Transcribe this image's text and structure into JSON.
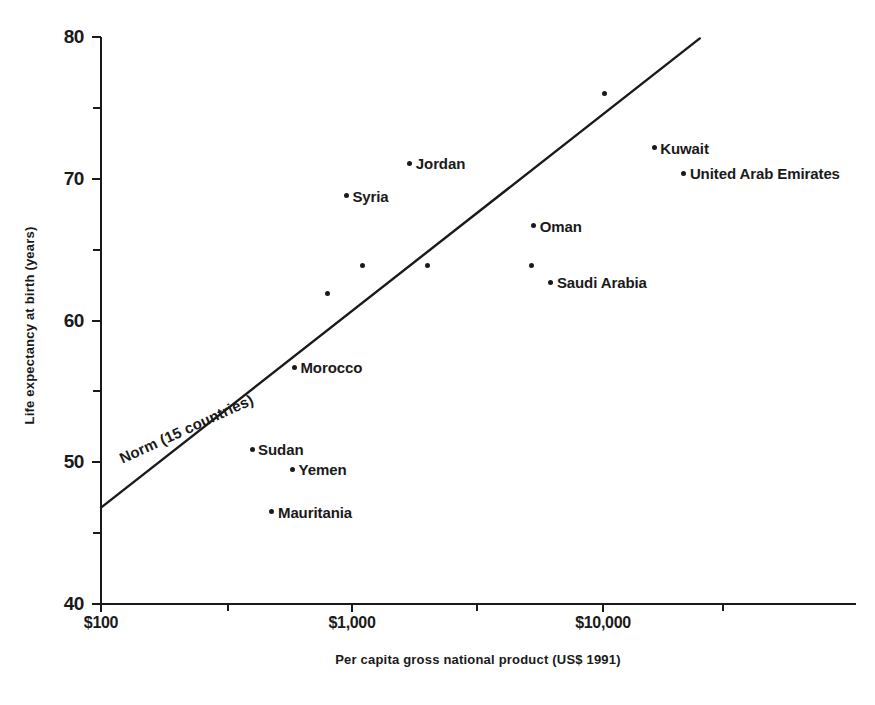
{
  "chart_data": {
    "type": "scatter",
    "title": "",
    "xlabel": "Per capita gross national product (US$ 1991)",
    "ylabel": "Life expectancy at birth (years)",
    "x_scale": "log",
    "y_scale": "linear",
    "xlim": [
      100,
      30000
    ],
    "ylim": [
      40,
      80
    ],
    "grid": false,
    "legend": false,
    "x_ticks_major": [
      {
        "value": 100,
        "label": "$100"
      },
      {
        "value": 1000,
        "label": "$1,000"
      },
      {
        "value": 10000,
        "label": "$10,000"
      }
    ],
    "x_ticks_minor": [
      320,
      3150,
      30000
    ],
    "y_ticks_major": [
      {
        "value": 40,
        "label": "40"
      },
      {
        "value": 50,
        "label": "50"
      },
      {
        "value": 60,
        "label": "60"
      },
      {
        "value": 70,
        "label": "70"
      },
      {
        "value": 80,
        "label": "80"
      }
    ],
    "y_ticks_minor": [
      45,
      55,
      65,
      75
    ],
    "points": [
      {
        "label": "Mauritania",
        "x": 480,
        "y": 46.5,
        "label_pos": "right"
      },
      {
        "label": "Sudan",
        "x": 400,
        "y": 50.9,
        "label_pos": "right"
      },
      {
        "label": "Yemen",
        "x": 580,
        "y": 49.5,
        "label_pos": "right"
      },
      {
        "label": "Morocco",
        "x": 590,
        "y": 56.7,
        "label_pos": "right"
      },
      {
        "label": "",
        "x": 800,
        "y": 61.9,
        "label_pos": "right"
      },
      {
        "label": "",
        "x": 1100,
        "y": 63.9,
        "label_pos": "right"
      },
      {
        "label": "Syria",
        "x": 950,
        "y": 68.8,
        "label_pos": "right"
      },
      {
        "label": "Jordan",
        "x": 1700,
        "y": 71.1,
        "label_pos": "right"
      },
      {
        "label": "",
        "x": 2000,
        "y": 63.9,
        "label_pos": "right"
      },
      {
        "label": "",
        "x": 5200,
        "y": 63.9,
        "label_pos": "right"
      },
      {
        "label": "Oman",
        "x": 5300,
        "y": 66.7,
        "label_pos": "right"
      },
      {
        "label": "Saudi Arabia",
        "x": 6200,
        "y": 62.7,
        "label_pos": "right"
      },
      {
        "label": "",
        "x": 10100,
        "y": 76.0,
        "label_pos": "right"
      },
      {
        "label": "Kuwait",
        "x": 16000,
        "y": 72.2,
        "label_pos": "right"
      },
      {
        "label": "United Arab Emirates",
        "x": 21000,
        "y": 70.4,
        "label_pos": "right"
      }
    ],
    "trend_line": {
      "label": "Norm  (15 countries)",
      "x_start": 100,
      "y_start": 46.8,
      "x_end": 24300,
      "y_end": 79.9
    }
  }
}
